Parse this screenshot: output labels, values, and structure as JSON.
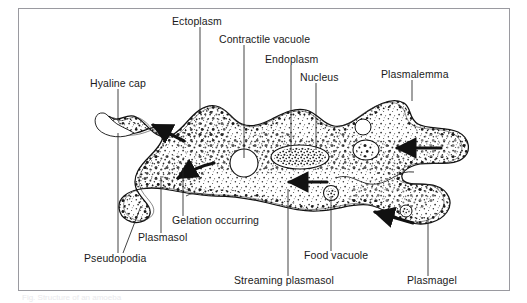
{
  "figure": {
    "subject": "amoeba",
    "border_color": "#9a9aa0",
    "background_color": "#ffffff",
    "ink_color": "#1a1a1a",
    "caption_partial": "Fig.  Structure of an amoeba"
  },
  "labels": [
    {
      "id": "ectoplasm",
      "text": "Ectoplasm",
      "x": 172,
      "y": 22,
      "anchor": "start"
    },
    {
      "id": "contractile-vacuole",
      "text": "Contractile vacuole",
      "x": 219,
      "y": 40,
      "anchor": "start"
    },
    {
      "id": "endoplasm",
      "text": "Endoplasm",
      "x": 265,
      "y": 60,
      "anchor": "start"
    },
    {
      "id": "nucleus",
      "text": "Nucleus",
      "x": 300,
      "y": 78,
      "anchor": "start"
    },
    {
      "id": "plasmalemma",
      "text": "Plasmalemma",
      "x": 381,
      "y": 75,
      "anchor": "start"
    },
    {
      "id": "hyaline-cap",
      "text": "Hyaline cap",
      "x": 90,
      "y": 84,
      "anchor": "start"
    },
    {
      "id": "gelation-occurring",
      "text": "Gelation occurring",
      "x": 172,
      "y": 221,
      "anchor": "start"
    },
    {
      "id": "plasmasol",
      "text": "Plasmasol",
      "x": 138,
      "y": 238,
      "anchor": "start"
    },
    {
      "id": "pseudopodia",
      "text": "Pseudopodia",
      "x": 84,
      "y": 259,
      "anchor": "start"
    },
    {
      "id": "food-vacuole",
      "text": "Food vacuole",
      "x": 304,
      "y": 256,
      "anchor": "start"
    },
    {
      "id": "streaming-plasmasol",
      "text": "Streaming plasmasol",
      "x": 234,
      "y": 281,
      "anchor": "start"
    },
    {
      "id": "plasmagel",
      "text": "Plasmagel",
      "x": 407,
      "y": 281,
      "anchor": "start"
    }
  ],
  "leader_lines": [
    {
      "id": "ectoplasm-leader",
      "points": "200,27 200,113"
    },
    {
      "id": "contractile-vacuole-leader",
      "points": "244,45 244,158"
    },
    {
      "id": "endoplasm-leader",
      "points": "291,65 291,152"
    },
    {
      "id": "nucleus-leader",
      "points": "316,83 316,150"
    },
    {
      "id": "plasmalemma-leader",
      "points": "412,80 412,101"
    },
    {
      "id": "hyaline-cap-leader",
      "points": "118,89 118,121"
    },
    {
      "id": "gelation-leader",
      "points": "183,216 183,168"
    },
    {
      "id": "plasmasol-leader",
      "points": "161,233 161,176"
    },
    {
      "id": "pseudopodia-leader-a",
      "points": "118,253 118,133"
    },
    {
      "id": "pseudopodia-leader-b",
      "points": "123,253 141,206"
    },
    {
      "id": "food-vacuole-leader",
      "points": "331,251 331,196"
    },
    {
      "id": "streaming-plasmasol-leader",
      "points": "288,276 288,189"
    },
    {
      "id": "plasmagel-leader",
      "points": "428,276 428,217"
    }
  ],
  "organelles": [
    {
      "id": "contractile-vacuole-body",
      "kind": "clear-vesicle",
      "cx": 244,
      "cy": 163,
      "rx": 14,
      "ry": 14
    },
    {
      "id": "nucleus-body",
      "kind": "granular-oval",
      "cx": 300,
      "cy": 157,
      "rx": 29,
      "ry": 12
    },
    {
      "id": "food-vacuole-body",
      "kind": "granular-round",
      "cx": 331,
      "cy": 193,
      "rx": 7.5,
      "ry": 7.5
    },
    {
      "id": "food-vacuole-body-2",
      "kind": "granular-round",
      "cx": 366,
      "cy": 150,
      "rx": 13,
      "ry": 10
    },
    {
      "id": "clear-vesicle-upper",
      "kind": "clear-vesicle",
      "cx": 363,
      "cy": 127,
      "rx": 8,
      "ry": 8
    },
    {
      "id": "food-vacuole-body-3",
      "kind": "granular-round",
      "cx": 406,
      "cy": 211,
      "rx": 6,
      "ry": 6
    }
  ],
  "streaming_arrows": [
    {
      "id": "arrow-forward-upper-left",
      "direction": "up-left",
      "path": "180,140 152,125"
    },
    {
      "id": "arrow-forward-lower-left",
      "direction": "down-left",
      "path": "212,163 177,177"
    },
    {
      "id": "arrow-backward-center",
      "direction": "left",
      "path": "326,182 288,182"
    },
    {
      "id": "arrow-backward-right",
      "direction": "left",
      "path": "440,148 396,148"
    },
    {
      "id": "arrow-backward-lower",
      "direction": "up-left",
      "path": "412,222 374,212"
    }
  ]
}
